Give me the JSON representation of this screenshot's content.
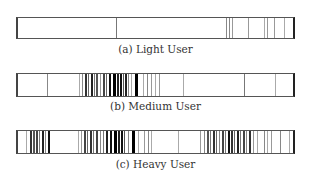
{
  "chart_data": {
    "type": "barcode",
    "title": "",
    "xlabel": "",
    "ylabel": "",
    "series": [
      {
        "name": "Light User",
        "caption": "(a) Light User",
        "top": 17,
        "height": 22,
        "lines": [
          {
            "x": 98,
            "w": 1,
            "c": "#777"
          },
          {
            "x": 208,
            "w": 1,
            "c": "#888"
          },
          {
            "x": 211,
            "w": 1,
            "c": "#888"
          },
          {
            "x": 214,
            "w": 1,
            "c": "#999"
          },
          {
            "x": 230,
            "w": 1,
            "c": "#999"
          },
          {
            "x": 246,
            "w": 1,
            "c": "#aaa"
          },
          {
            "x": 249,
            "w": 1,
            "c": "#999"
          },
          {
            "x": 256,
            "w": 1,
            "c": "#999"
          },
          {
            "x": 266,
            "w": 1,
            "c": "#aaa"
          },
          {
            "x": 275,
            "w": 2,
            "c": "#222"
          }
        ]
      },
      {
        "name": "Medium User",
        "caption": "(b) Medium User",
        "top": 73,
        "height": 24,
        "lines": [
          {
            "x": 29,
            "w": 1,
            "c": "#888"
          },
          {
            "x": 61,
            "w": 1,
            "c": "#aaa"
          },
          {
            "x": 64,
            "w": 1,
            "c": "#888"
          },
          {
            "x": 67,
            "w": 2,
            "c": "#333"
          },
          {
            "x": 70,
            "w": 1,
            "c": "#666"
          },
          {
            "x": 73,
            "w": 2,
            "c": "#222"
          },
          {
            "x": 76,
            "w": 1,
            "c": "#777"
          },
          {
            "x": 78,
            "w": 2,
            "c": "#555"
          },
          {
            "x": 82,
            "w": 1,
            "c": "#999"
          },
          {
            "x": 85,
            "w": 2,
            "c": "#444"
          },
          {
            "x": 88,
            "w": 1,
            "c": "#666"
          },
          {
            "x": 91,
            "w": 2,
            "c": "#111"
          },
          {
            "x": 95,
            "w": 3,
            "c": "#000"
          },
          {
            "x": 99,
            "w": 2,
            "c": "#222"
          },
          {
            "x": 102,
            "w": 2,
            "c": "#111"
          },
          {
            "x": 105,
            "w": 1,
            "c": "#555"
          },
          {
            "x": 107,
            "w": 2,
            "c": "#222"
          },
          {
            "x": 110,
            "w": 1,
            "c": "#888"
          },
          {
            "x": 113,
            "w": 1,
            "c": "#aaa"
          },
          {
            "x": 117,
            "w": 3,
            "c": "#000"
          },
          {
            "x": 125,
            "w": 1,
            "c": "#aaa"
          },
          {
            "x": 129,
            "w": 1,
            "c": "#888"
          },
          {
            "x": 133,
            "w": 1,
            "c": "#999"
          },
          {
            "x": 137,
            "w": 1,
            "c": "#aaa"
          },
          {
            "x": 141,
            "w": 1,
            "c": "#999"
          },
          {
            "x": 165,
            "w": 1,
            "c": "#aaa"
          },
          {
            "x": 226,
            "w": 1,
            "c": "#777"
          },
          {
            "x": 257,
            "w": 1,
            "c": "#aaa"
          }
        ]
      },
      {
        "name": "Heavy User",
        "caption": "(c) Heavy User",
        "top": 130,
        "height": 24,
        "lines": [
          {
            "x": 8,
            "w": 1,
            "c": "#aaa"
          },
          {
            "x": 12,
            "w": 2,
            "c": "#333"
          },
          {
            "x": 15,
            "w": 2,
            "c": "#555"
          },
          {
            "x": 18,
            "w": 2,
            "c": "#444"
          },
          {
            "x": 21,
            "w": 1,
            "c": "#777"
          },
          {
            "x": 24,
            "w": 2,
            "c": "#222"
          },
          {
            "x": 27,
            "w": 1,
            "c": "#888"
          },
          {
            "x": 30,
            "w": 2,
            "c": "#111"
          },
          {
            "x": 60,
            "w": 1,
            "c": "#aaa"
          },
          {
            "x": 63,
            "w": 1,
            "c": "#999"
          },
          {
            "x": 66,
            "w": 2,
            "c": "#444"
          },
          {
            "x": 69,
            "w": 1,
            "c": "#666"
          },
          {
            "x": 72,
            "w": 2,
            "c": "#333"
          },
          {
            "x": 75,
            "w": 1,
            "c": "#777"
          },
          {
            "x": 78,
            "w": 2,
            "c": "#444"
          },
          {
            "x": 82,
            "w": 1,
            "c": "#888"
          },
          {
            "x": 85,
            "w": 1,
            "c": "#777"
          },
          {
            "x": 88,
            "w": 2,
            "c": "#222"
          },
          {
            "x": 92,
            "w": 2,
            "c": "#111"
          },
          {
            "x": 96,
            "w": 3,
            "c": "#000"
          },
          {
            "x": 100,
            "w": 2,
            "c": "#222"
          },
          {
            "x": 103,
            "w": 2,
            "c": "#111"
          },
          {
            "x": 106,
            "w": 1,
            "c": "#555"
          },
          {
            "x": 110,
            "w": 1,
            "c": "#888"
          },
          {
            "x": 114,
            "w": 3,
            "c": "#000"
          },
          {
            "x": 120,
            "w": 1,
            "c": "#aaa"
          },
          {
            "x": 126,
            "w": 1,
            "c": "#999"
          },
          {
            "x": 130,
            "w": 1,
            "c": "#888"
          },
          {
            "x": 133,
            "w": 1,
            "c": "#aaa"
          },
          {
            "x": 160,
            "w": 1,
            "c": "#aaa"
          },
          {
            "x": 182,
            "w": 1,
            "c": "#999"
          },
          {
            "x": 186,
            "w": 1,
            "c": "#888"
          },
          {
            "x": 189,
            "w": 2,
            "c": "#555"
          },
          {
            "x": 192,
            "w": 1,
            "c": "#777"
          },
          {
            "x": 195,
            "w": 2,
            "c": "#333"
          },
          {
            "x": 198,
            "w": 1,
            "c": "#666"
          },
          {
            "x": 201,
            "w": 1,
            "c": "#888"
          },
          {
            "x": 204,
            "w": 2,
            "c": "#444"
          },
          {
            "x": 207,
            "w": 1,
            "c": "#777"
          },
          {
            "x": 210,
            "w": 2,
            "c": "#111"
          },
          {
            "x": 213,
            "w": 2,
            "c": "#333"
          },
          {
            "x": 216,
            "w": 1,
            "c": "#666"
          },
          {
            "x": 219,
            "w": 2,
            "c": "#222"
          },
          {
            "x": 222,
            "w": 1,
            "c": "#777"
          },
          {
            "x": 225,
            "w": 2,
            "c": "#444"
          },
          {
            "x": 228,
            "w": 1,
            "c": "#888"
          },
          {
            "x": 231,
            "w": 2,
            "c": "#333"
          },
          {
            "x": 235,
            "w": 1,
            "c": "#999"
          },
          {
            "x": 239,
            "w": 1,
            "c": "#aaa"
          },
          {
            "x": 246,
            "w": 1,
            "c": "#888"
          },
          {
            "x": 249,
            "w": 1,
            "c": "#aaa"
          },
          {
            "x": 253,
            "w": 1,
            "c": "#999"
          },
          {
            "x": 262,
            "w": 1,
            "c": "#888"
          },
          {
            "x": 271,
            "w": 1,
            "c": "#aaa"
          }
        ]
      }
    ]
  },
  "captions": {
    "light": "(a) Light User",
    "medium": "(b) Medium User",
    "heavy": "(c) Heavy User"
  }
}
